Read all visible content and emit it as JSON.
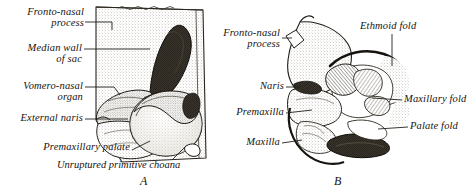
{
  "figure": {
    "title_absent": true,
    "panels": [
      {
        "letter": "A",
        "name": "panel-a",
        "caption": "Unruptured primitive choana",
        "labels": [
          {
            "id": "fronto-nasal-process",
            "lines": [
              "Fronto-nasal",
              "process"
            ]
          },
          {
            "id": "median-wall-of-sac",
            "lines": [
              "Median wall",
              "of sac"
            ]
          },
          {
            "id": "vomero-nasal-organ",
            "lines": [
              "Vomero-nasal",
              "organ"
            ]
          },
          {
            "id": "external-naris",
            "lines": [
              "External naris"
            ]
          },
          {
            "id": "premaxillary-palate",
            "lines": [
              "Premaxillary palate"
            ]
          }
        ]
      },
      {
        "letter": "B",
        "name": "panel-b",
        "caption": "",
        "labels": [
          {
            "id": "fronto-nasal-process",
            "lines": [
              "Fronto-nasal",
              "process"
            ]
          },
          {
            "id": "ethmoid-fold",
            "lines": [
              "Ethmoid fold"
            ]
          },
          {
            "id": "naris",
            "lines": [
              "Naris"
            ]
          },
          {
            "id": "premaxilla",
            "lines": [
              "Premaxilla"
            ]
          },
          {
            "id": "maxilla",
            "lines": [
              "Maxilla"
            ]
          },
          {
            "id": "maxillary-fold",
            "lines": [
              "Maxillary fold"
            ]
          },
          {
            "id": "palate-fold",
            "lines": [
              "Palate fold"
            ]
          }
        ]
      }
    ]
  },
  "panel_a": {
    "label_fronto_nasal_1": "Fronto-nasal",
    "label_fronto_nasal_2": "process",
    "label_median_wall_1": "Median wall",
    "label_median_wall_2": "of sac",
    "label_vomero_nasal_1": "Vomero-nasal",
    "label_vomero_nasal_2": "organ",
    "label_external_naris": "External naris",
    "label_premaxillary_palate": "Premaxillary palate",
    "caption": "Unruptured primitive choana",
    "letter": "A"
  },
  "panel_b": {
    "label_fronto_nasal_1": "Fronto-nasal",
    "label_fronto_nasal_2": "process",
    "label_ethmoid_fold": "Ethmoid fold",
    "label_naris": "Naris",
    "label_premaxilla": "Premaxilla",
    "label_maxilla": "Maxilla",
    "label_maxillary_fold": "Maxillary fold",
    "label_palate_fold": "Palate fold",
    "letter": "B"
  },
  "colors": {
    "ink": "#16130f",
    "line": "#20201c",
    "paper": "#ffffff",
    "stipple_light": "#b9b2a4",
    "stipple_mid": "#6f6a5f",
    "shade_dark": "#2a261f"
  }
}
